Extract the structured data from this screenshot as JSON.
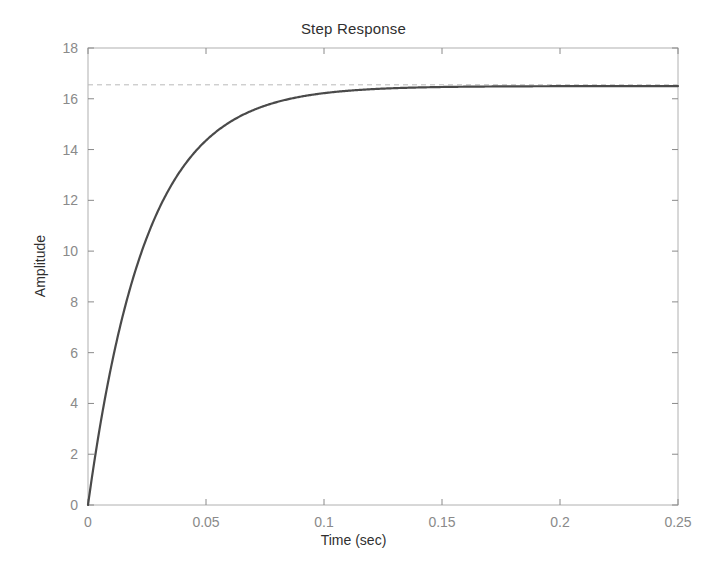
{
  "figure": {
    "background": "#ffffff",
    "title": "Step Response",
    "xlabel": "Time (sec)",
    "ylabel": "Amplitude"
  },
  "chart_data": {
    "type": "line",
    "title": "Step Response",
    "xlabel": "Time (sec)",
    "ylabel": "Amplitude",
    "xlim": [
      0,
      0.25
    ],
    "ylim": [
      0,
      18
    ],
    "xticks": [
      0,
      0.05,
      0.1,
      0.15,
      0.2,
      0.25
    ],
    "xtick_labels": [
      "0",
      "0.05",
      "0.1",
      "0.15",
      "0.2",
      "0.25"
    ],
    "yticks": [
      0,
      2,
      4,
      6,
      8,
      10,
      12,
      14,
      16,
      18
    ],
    "ytick_labels": [
      "0",
      "2",
      "4",
      "6",
      "8",
      "10",
      "12",
      "14",
      "16",
      "18"
    ],
    "grid": false,
    "legend": null,
    "box": true,
    "tick_direction": "in",
    "series": [
      {
        "name": "step-response",
        "kind": "line",
        "color": "#4a4a4a",
        "linewidth": 2.2,
        "linestyle": "solid",
        "model": "first-order",
        "steady_state": 16.5,
        "time_constant": 0.0245,
        "x": [
          0,
          0.0025,
          0.005,
          0.0075,
          0.01,
          0.0125,
          0.015,
          0.0175,
          0.02,
          0.0225,
          0.025,
          0.0275,
          0.03,
          0.0325,
          0.035,
          0.0375,
          0.04,
          0.045,
          0.05,
          0.055,
          0.06,
          0.065,
          0.07,
          0.075,
          0.08,
          0.085,
          0.09,
          0.095,
          0.1,
          0.11,
          0.12,
          0.13,
          0.14,
          0.15,
          0.16,
          0.17,
          0.18,
          0.19,
          0.2,
          0.21,
          0.22,
          0.23,
          0.24,
          0.25
        ],
        "y": [
          0.0,
          1.59,
          3.04,
          4.35,
          5.54,
          6.62,
          7.6,
          8.49,
          9.3,
          10.03,
          10.7,
          11.3,
          11.85,
          12.35,
          12.8,
          13.21,
          13.58,
          14.21,
          14.73,
          15.15,
          15.49,
          15.77,
          16.0,
          16.19,
          16.34,
          16.46,
          16.56,
          16.64,
          16.71,
          16.81,
          16.86,
          16.9,
          16.92,
          16.93,
          16.93,
          16.93,
          16.93,
          16.93,
          16.93,
          16.93,
          16.93,
          16.93,
          16.93,
          16.93
        ]
      },
      {
        "name": "steady-state-reference",
        "kind": "hline",
        "color": "#b9b9b9",
        "linewidth": 1,
        "linestyle": "dashed",
        "value": 16.55
      }
    ]
  },
  "axes": {
    "color": "#b0b0b0",
    "tick_color": "#8a8a8a",
    "curve_color": "#4a4a4a",
    "reference_color": "#b9b9b9"
  }
}
